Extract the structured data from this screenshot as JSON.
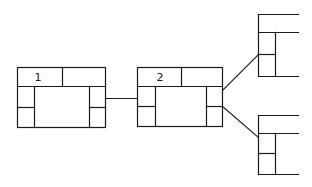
{
  "diagram": {
    "type": "block-tree",
    "stroke_color": "#1a1a1a",
    "background": "#ffffff",
    "nodes": [
      {
        "id": "node-1",
        "label": "1"
      },
      {
        "id": "node-2",
        "label": "2"
      },
      {
        "id": "node-3",
        "label": ""
      },
      {
        "id": "node-4",
        "label": ""
      }
    ],
    "edges": [
      {
        "from": "node-1",
        "to": "node-2"
      },
      {
        "from": "node-2",
        "to": "node-3"
      },
      {
        "from": "node-2",
        "to": "node-4"
      }
    ]
  }
}
